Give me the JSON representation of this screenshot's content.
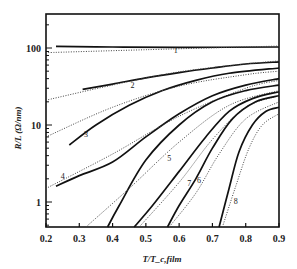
{
  "chart_data": {
    "type": "line",
    "title": "",
    "xlabel": "T/T_c,film",
    "ylabel": "R/L (Ω/nm)",
    "xlim": [
      0.2,
      0.9
    ],
    "ylim": [
      0.47,
      280
    ],
    "yscale": "log",
    "grid": false,
    "legend": "curve number labels placed on plot",
    "x_ticks": [
      "0.2",
      "0.3",
      "0.4",
      "0.5",
      "0.6",
      "0.7",
      "0.8",
      "0.9"
    ],
    "y_ticks": [
      "1",
      "10",
      "100"
    ],
    "series": [
      {
        "name": "1",
        "style": "solid",
        "points": [
          [
            0.23,
            105
          ],
          [
            0.4,
            103
          ],
          [
            0.6,
            102
          ],
          [
            0.9,
            103
          ]
        ]
      },
      {
        "name": "1 fit",
        "style": "dotted",
        "points": [
          [
            0.2,
            87
          ],
          [
            0.5,
            95
          ],
          [
            0.9,
            106
          ]
        ]
      },
      {
        "name": "2",
        "style": "solid",
        "points": [
          [
            0.31,
            29
          ],
          [
            0.4,
            34
          ],
          [
            0.5,
            41
          ],
          [
            0.6,
            48
          ],
          [
            0.7,
            55
          ],
          [
            0.8,
            62
          ],
          [
            0.9,
            66
          ]
        ]
      },
      {
        "name": "2 fit",
        "style": "dotted",
        "points": [
          [
            0.2,
            21
          ],
          [
            0.4,
            33
          ],
          [
            0.6,
            49
          ],
          [
            0.8,
            62
          ],
          [
            0.9,
            68
          ]
        ]
      },
      {
        "name": "3",
        "style": "solid",
        "points": [
          [
            0.27,
            5.5
          ],
          [
            0.35,
            10
          ],
          [
            0.45,
            18
          ],
          [
            0.55,
            28
          ],
          [
            0.65,
            38
          ],
          [
            0.75,
            47
          ],
          [
            0.9,
            55
          ]
        ]
      },
      {
        "name": "3 fit",
        "style": "dotted",
        "points": [
          [
            0.2,
            7
          ],
          [
            0.4,
            17
          ],
          [
            0.6,
            32
          ],
          [
            0.8,
            45
          ],
          [
            0.9,
            50
          ]
        ]
      },
      {
        "name": "4",
        "style": "solid",
        "points": [
          [
            0.23,
            1.6
          ],
          [
            0.3,
            2.2
          ],
          [
            0.4,
            3.3
          ],
          [
            0.5,
            7
          ],
          [
            0.6,
            14
          ],
          [
            0.7,
            24
          ],
          [
            0.8,
            33
          ],
          [
            0.9,
            40
          ]
        ]
      },
      {
        "name": "4 fit",
        "style": "dotted",
        "points": [
          [
            0.2,
            1.5
          ],
          [
            0.4,
            4.2
          ],
          [
            0.6,
            13
          ],
          [
            0.8,
            30
          ],
          [
            0.9,
            38
          ]
        ]
      },
      {
        "name": "5",
        "style": "solid",
        "points": [
          [
            0.385,
            0.47
          ],
          [
            0.42,
            0.9
          ],
          [
            0.5,
            3.5
          ],
          [
            0.6,
            10
          ],
          [
            0.7,
            20
          ],
          [
            0.8,
            28
          ],
          [
            0.9,
            33
          ]
        ]
      },
      {
        "name": "5 fit",
        "style": "dotted",
        "points": [
          [
            0.32,
            0.47
          ],
          [
            0.45,
            1.5
          ],
          [
            0.6,
            6
          ],
          [
            0.75,
            18
          ],
          [
            0.9,
            28
          ]
        ]
      },
      {
        "name": "7",
        "style": "solid",
        "points": [
          [
            0.465,
            0.47
          ],
          [
            0.52,
            0.9
          ],
          [
            0.6,
            2.5
          ],
          [
            0.68,
            7
          ],
          [
            0.75,
            15
          ],
          [
            0.82,
            22
          ],
          [
            0.9,
            27
          ]
        ]
      },
      {
        "name": "7 fit",
        "style": "dotted",
        "points": [
          [
            0.48,
            0.47
          ],
          [
            0.6,
            1.8
          ],
          [
            0.7,
            6.5
          ],
          [
            0.8,
            17
          ],
          [
            0.9,
            24
          ]
        ]
      },
      {
        "name": "6",
        "style": "solid",
        "points": [
          [
            0.565,
            0.47
          ],
          [
            0.6,
            0.9
          ],
          [
            0.65,
            2
          ],
          [
            0.7,
            5
          ],
          [
            0.76,
            12
          ],
          [
            0.83,
            20
          ],
          [
            0.9,
            24
          ]
        ]
      },
      {
        "name": "6 fit",
        "style": "dotted",
        "points": [
          [
            0.57,
            0.47
          ],
          [
            0.65,
            1.3
          ],
          [
            0.72,
            4.2
          ],
          [
            0.8,
            12
          ],
          [
            0.9,
            20
          ]
        ]
      },
      {
        "name": "8",
        "style": "solid",
        "points": [
          [
            0.72,
            0.47
          ],
          [
            0.75,
            1.5
          ],
          [
            0.78,
            4.5
          ],
          [
            0.82,
            10
          ],
          [
            0.86,
            15
          ],
          [
            0.9,
            17
          ]
        ]
      },
      {
        "name": "8 fit",
        "style": "dotted",
        "points": [
          [
            0.73,
            0.47
          ],
          [
            0.77,
            1.6
          ],
          [
            0.81,
            5
          ],
          [
            0.85,
            10
          ],
          [
            0.9,
            14
          ]
        ]
      }
    ],
    "curve_labels": [
      {
        "text": "1",
        "x": 0.59,
        "y": 86
      },
      {
        "text": "2",
        "x": 0.46,
        "y": 30
      },
      {
        "text": "3",
        "x": 0.32,
        "y": 7
      },
      {
        "text": "4",
        "x": 0.25,
        "y": 2.0
      },
      {
        "text": "5",
        "x": 0.57,
        "y": 3.4
      },
      {
        "text": "7",
        "x": 0.63,
        "y": 1.6
      },
      {
        "text": "6",
        "x": 0.66,
        "y": 1.75
      },
      {
        "text": "8",
        "x": 0.77,
        "y": 0.95
      }
    ]
  }
}
